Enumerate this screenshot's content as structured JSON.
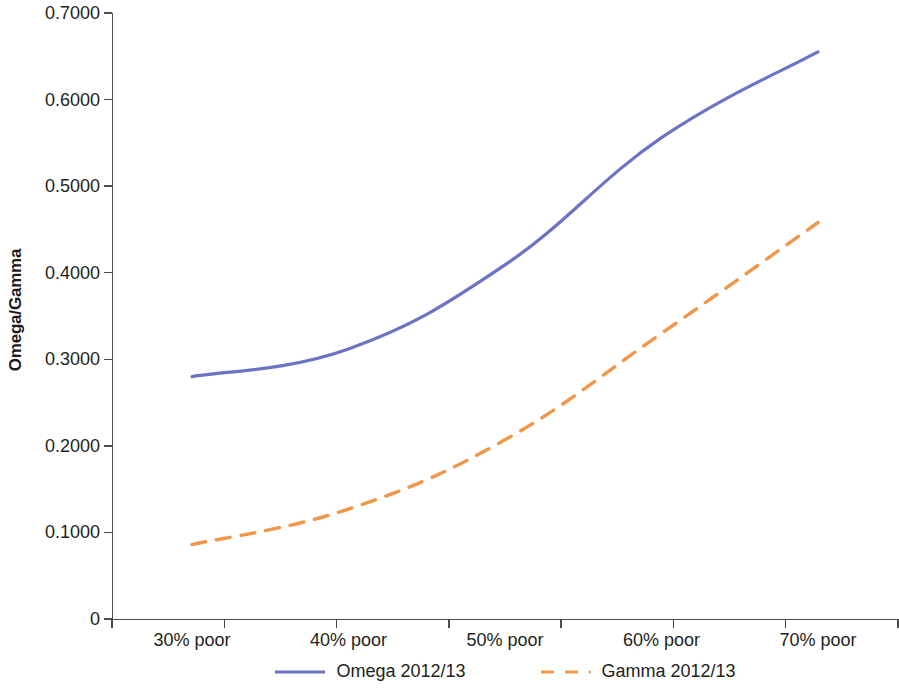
{
  "chart_data": {
    "type": "line",
    "title": "",
    "xlabel": "",
    "ylabel": "Omega/Gamma",
    "categories": [
      "30% poor",
      "40% poor",
      "50% poor",
      "60% poor",
      "70% poor"
    ],
    "series": [
      {
        "name": "Omega 2012/13",
        "values": [
          0.28,
          0.312,
          0.409,
          0.556,
          0.655
        ],
        "color": "#6b73c4",
        "style": "solid"
      },
      {
        "name": "Gamma 2012/13",
        "values": [
          0.086,
          0.127,
          0.207,
          0.33,
          0.458
        ],
        "color": "#f0974a",
        "style": "dashed"
      }
    ],
    "ylim": [
      0,
      0.7
    ],
    "yticks": [
      0,
      0.1,
      0.2,
      0.3,
      0.4,
      0.5,
      0.6,
      0.7
    ],
    "ytick_labels": [
      "0",
      "0.1000",
      "0.2000",
      "0.3000",
      "0.4000",
      "0.5000",
      "0.6000",
      "0.7000"
    ],
    "grid": false,
    "legend_position": "bottom"
  },
  "legend": {
    "entries": [
      {
        "label": "Omega 2012/13"
      },
      {
        "label": "Gamma 2012/13"
      }
    ]
  },
  "axes": {
    "y_title": "Omega/Gamma"
  }
}
